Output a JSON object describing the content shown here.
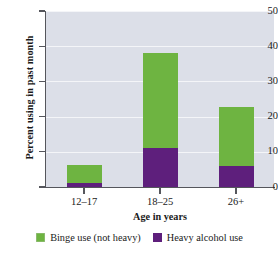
{
  "chart_data": {
    "type": "bar",
    "subtype": "stacked-vertical",
    "title": "",
    "categories": [
      "12–17",
      "18–25",
      "26+"
    ],
    "series": [
      {
        "name": "Binge use (not heavy)",
        "values": [
          5.2,
          27.0,
          16.7
        ],
        "color": "#6eb441"
      },
      {
        "name": "Heavy alcohol use",
        "values": [
          1.0,
          11.0,
          6.0
        ],
        "color": "#5e1f7c"
      }
    ],
    "stack_totals": [
      6.2,
      38.0,
      22.7
    ],
    "xlabel": "Age in years",
    "ylabel": "Percent using in past month",
    "ylim": [
      0,
      50
    ],
    "yticks": [
      0,
      10,
      20,
      30,
      40,
      50
    ],
    "ytick_labels": [
      "0",
      "10",
      "20",
      "30",
      "40",
      "50"
    ],
    "grid": true,
    "grid_axis": "y",
    "legend_position": "bottom",
    "plot_background": "#dcdfe8",
    "figure_background": "#ffffff",
    "axis_color": "#55565c",
    "gridline_color": "#f4f5f8"
  },
  "axes": {
    "y_title": "Percent using in past month",
    "x_title": "Age in years"
  },
  "legend": {
    "items": [
      {
        "label": "Binge use (not heavy)",
        "swatch": "legend-swatch-binge"
      },
      {
        "label": "Heavy alcohol use",
        "swatch": "legend-swatch-heavy"
      }
    ]
  }
}
